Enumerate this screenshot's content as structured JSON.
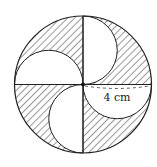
{
  "figure": {
    "type": "geometry-diagram",
    "center": [
      83,
      84.5
    ],
    "radius": 68.5,
    "stroke_color": "#222222",
    "hatch_color": "#333333",
    "fill_color": "#ffffff",
    "dimension_label": "4 cm",
    "dimension_refers_to": "radius of large circle (diameter of each small semicircle)"
  }
}
